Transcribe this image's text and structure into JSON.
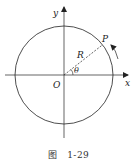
{
  "diagram": {
    "labels": {
      "y_axis": "y",
      "x_axis": "x",
      "origin": "O",
      "point": "P",
      "radius": "R",
      "angle": "θ"
    },
    "geometry": {
      "center": [
        64,
        75
      ],
      "radius": 49,
      "point_angle_deg": 38
    },
    "colors": {
      "stroke": "#222222",
      "background": "#ffffff"
    }
  },
  "caption": {
    "prefix": "图",
    "number": "1-29"
  }
}
